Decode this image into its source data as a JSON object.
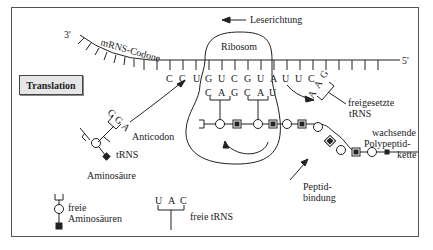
{
  "title_box": "Translation",
  "labels": {
    "mrna_codons": "mRNS-Codone",
    "three_prime": "3'",
    "five_prime": "5'",
    "reading_direction": "Leserichtung",
    "ribosome": "Ribosom",
    "anticodon": "Anticodon",
    "trna": "tRNS",
    "amino_acid": "Aminosäure",
    "released_trna_1": "freigesetzte",
    "released_trna_2": "tRNS",
    "growing_chain_1": "wachsende",
    "growing_chain_2": "Polypeptid-",
    "growing_chain_3": "kette",
    "peptide_bond_1": "Peptid-",
    "peptide_bond_2": "bindung",
    "free_amino_acids_1": "freie",
    "free_amino_acids_2": "Aminosäuren",
    "free_trna": "freie tRNS"
  },
  "mrna_bases": [
    "C",
    "C",
    "U",
    "G",
    "U",
    "C",
    "G",
    "U",
    "A",
    "U",
    "U",
    "C"
  ],
  "ribosome_anticodons": [
    "C",
    "A",
    "G",
    "C",
    "A",
    "U"
  ],
  "incoming_trna_anticodon": [
    "G",
    "G",
    "A"
  ],
  "released_trna_anticodon": [
    "A",
    "A",
    "G"
  ],
  "free_trna_anticodon": [
    "U",
    "A",
    "C"
  ],
  "colors": {
    "line": "#222222",
    "frame": "#555555",
    "title_bg": "#e6e6e6"
  }
}
